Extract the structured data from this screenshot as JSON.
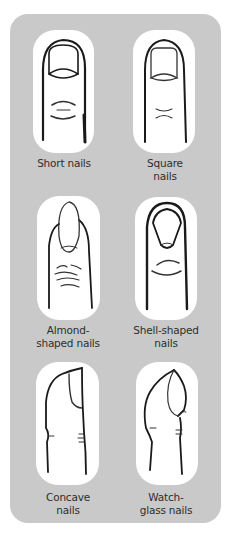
{
  "figure": {
    "colors": {
      "panel_background": "#c9c9c9",
      "card_background": "#ffffff",
      "ink": "#1a1a1a",
      "label_text": "#2e2e2e"
    },
    "items": [
      {
        "id": "short",
        "label_line1": "Short nails",
        "label_line2": "",
        "view": "front",
        "icon": "short-nail-finger-icon"
      },
      {
        "id": "square",
        "label_line1": "Square",
        "label_line2": "nails",
        "view": "front",
        "icon": "square-nail-finger-icon"
      },
      {
        "id": "almond",
        "label_line1": "Almond-",
        "label_line2": "shaped nails",
        "view": "front",
        "icon": "almond-nail-finger-icon"
      },
      {
        "id": "shell",
        "label_line1": "Shell-shaped",
        "label_line2": "nails",
        "view": "front",
        "icon": "shell-nail-finger-icon"
      },
      {
        "id": "concave",
        "label_line1": "Concave",
        "label_line2": "nails",
        "view": "side",
        "icon": "concave-nail-finger-icon"
      },
      {
        "id": "watchglass",
        "label_line1": "Watch-",
        "label_line2": "glass nails",
        "view": "side",
        "icon": "watch-glass-nail-finger-icon"
      }
    ]
  }
}
